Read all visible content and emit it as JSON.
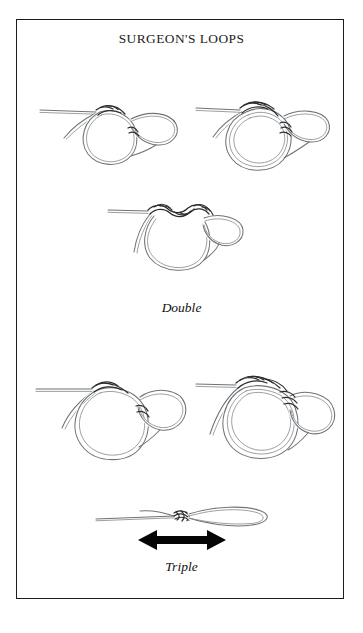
{
  "page": {
    "title": "SURGEON'S LOOPS",
    "background_color": "#ffffff",
    "border_color": "#1c1c1c",
    "corner_mark": ""
  },
  "captions": {
    "double": "Double",
    "triple": "Triple"
  },
  "figures": [
    {
      "id": "fig-1",
      "name": "double-loop-step-1",
      "caption_group": "Double",
      "description": "Doubled line formed into a loop with one overhand turn at the crossing point, tag end at left."
    },
    {
      "id": "fig-2",
      "name": "double-loop-step-2",
      "caption_group": "Double",
      "description": "Doubled line passed through the loop a second time forming two wraps."
    },
    {
      "id": "fig-3",
      "name": "double-loop-step-3",
      "caption_group": "Double",
      "description": "Knot drawn up showing two twists across the top with the loop hanging below."
    },
    {
      "id": "fig-4",
      "name": "triple-loop-step-1",
      "caption_group": "Triple",
      "description": "Doubled line formed into a large loop with the tag end passed through once."
    },
    {
      "id": "fig-5",
      "name": "triple-loop-step-2",
      "caption_group": "Triple",
      "description": "Doubled line passed through the loop three times forming three wraps."
    },
    {
      "id": "fig-6",
      "name": "triple-loop-finished",
      "caption_group": "Triple",
      "description": "Finished surgeon's loop drawn tight with a long tapered loop at the right."
    }
  ],
  "annotations": {
    "pull_arrow": {
      "name": "pull-direction-arrow",
      "type": "double-headed-horizontal-arrow",
      "color": "#050505"
    }
  },
  "colors": {
    "line": "#6f7376",
    "line_dark": "#2b2d2f",
    "ink": "#1a1a1a",
    "paper": "#ffffff"
  }
}
